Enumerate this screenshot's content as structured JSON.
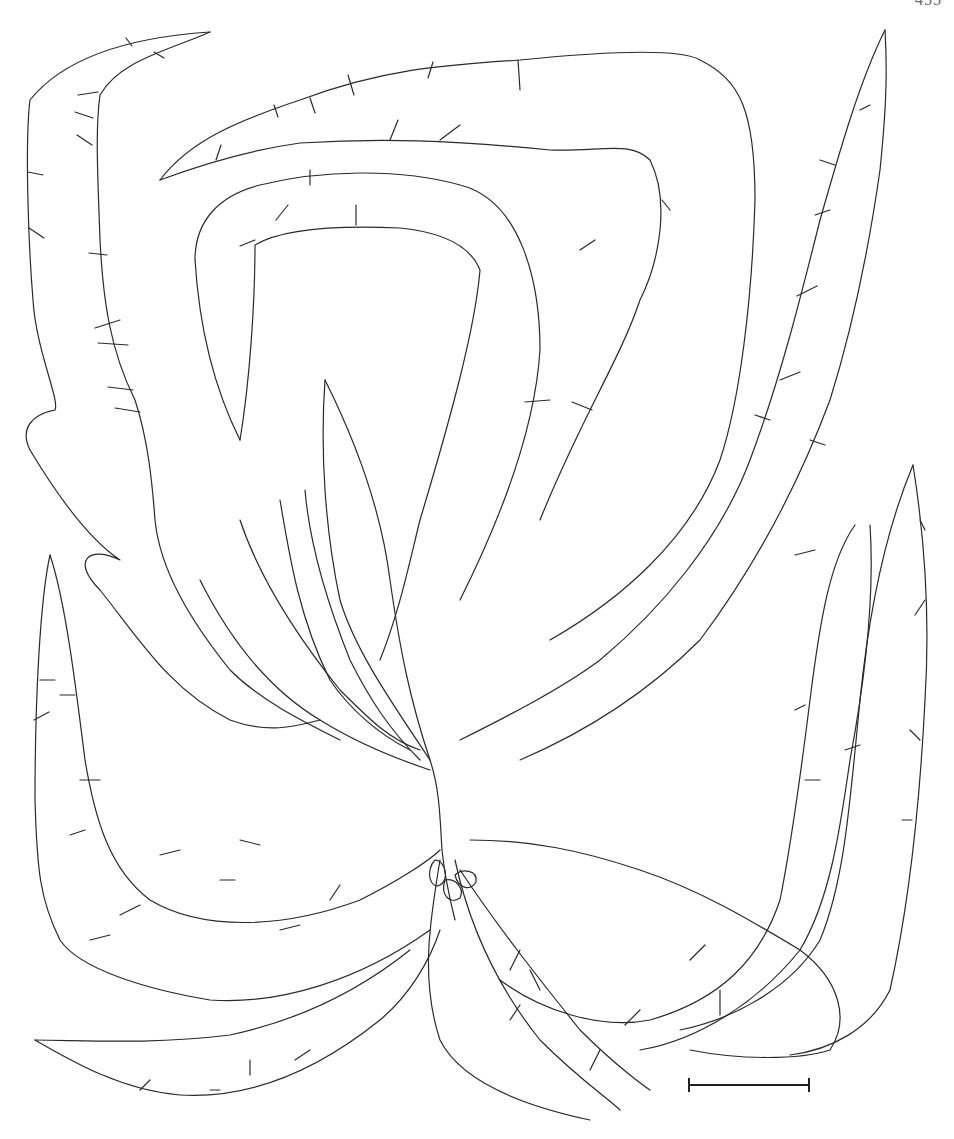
{
  "page": {
    "page_number": "455",
    "page_number_note": "partially cropped at top edge"
  },
  "figure": {
    "colors": {
      "line": "#2a2a2a",
      "background": "#ffffff"
    }
  },
  "scale_bar": {
    "label": "",
    "x_start": 688,
    "x_end": 810,
    "y": 1085
  }
}
